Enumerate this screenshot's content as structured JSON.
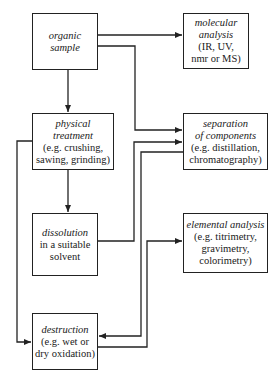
{
  "nodes": {
    "organic_sample": {
      "title": [
        "organic",
        "sample"
      ],
      "detail": []
    },
    "molecular_analysis": {
      "title": [
        "molecular",
        "analysis"
      ],
      "detail": [
        "(IR, UV,",
        "nmr or MS)"
      ]
    },
    "physical_treatment": {
      "title": [
        "physical",
        "treatment"
      ],
      "detail": [
        "(e.g. crushing,",
        "sawing, grinding)"
      ]
    },
    "separation": {
      "title": [
        "separation",
        "of components"
      ],
      "detail": [
        "(e.g. distillation,",
        "chromatography)"
      ]
    },
    "dissolution": {
      "title": [
        "dissolution"
      ],
      "detail": [
        "in a suitable",
        "solvent"
      ]
    },
    "elemental_analysis": {
      "title": [
        "elemental analysis"
      ],
      "detail": [
        "(e.g. titrimetry,",
        "gravimetry,",
        "colorimetry)"
      ]
    },
    "destruction": {
      "title": [
        "destruction"
      ],
      "detail": [
        "(e.g. wet or",
        "dry oxidation)"
      ]
    }
  },
  "edges": [
    {
      "from": "organic sample",
      "to": "molecular analysis"
    },
    {
      "from": "organic sample",
      "to": "separation of components"
    },
    {
      "from": "organic sample",
      "to": "physical treatment"
    },
    {
      "from": "physical treatment",
      "to": "dissolution"
    },
    {
      "from": "physical treatment",
      "to": "destruction"
    },
    {
      "from": "dissolution",
      "to": "separation of components"
    },
    {
      "from": "separation of components",
      "to": "destruction"
    },
    {
      "from": "destruction",
      "to": "elemental analysis"
    }
  ],
  "colors": {
    "line": "#222222",
    "background": "#ffffff"
  }
}
